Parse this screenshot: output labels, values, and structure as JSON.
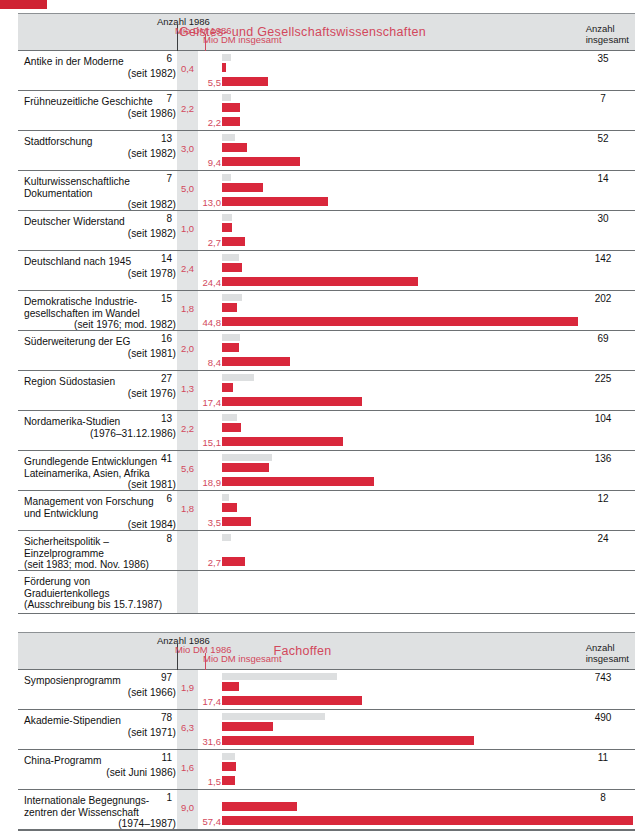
{
  "decoration": {
    "corner_color": "#cf2233"
  },
  "colors": {
    "red": "#d9283c",
    "red_text": "#d2485c",
    "gray_bar": "#dddfe0",
    "band": "#dfe1e2",
    "rule": "#6d7174"
  },
  "sections": [
    {
      "header": {
        "anzahl_label": "Anzahl 1986",
        "mio_1986_label": "Mio DM 1986",
        "mio_total_label": "Mio DM insgesamt",
        "title": "Geistes- und Gesellschaftswissenschaften",
        "right_line1": "Anzahl",
        "right_line2": "insgesamt"
      },
      "rows": [
        {
          "name": "Antike in der Moderne",
          "since": "(seit 1982)",
          "count": "6",
          "mio1986": "0,4",
          "mio_total": "5,5",
          "total": "35",
          "gray_w": 9,
          "red1_w": 4,
          "red2_w": 46
        },
        {
          "name": "Frühneuzeitliche Geschichte",
          "since": "(seit 1986)",
          "count": "7",
          "mio1986": "2,2",
          "mio_total": "2,2",
          "total": "7",
          "gray_w": 9,
          "red1_w": 18,
          "red2_w": 18
        },
        {
          "name": "Stadtforschung",
          "since": "(seit 1982)",
          "count": "13",
          "mio1986": "3,0",
          "mio_total": "9,4",
          "total": "52",
          "gray_w": 13,
          "red1_w": 25,
          "red2_w": 78
        },
        {
          "name": "Kulturwissenschaftliche<br>Dokumentation",
          "since": "(seit 1982)",
          "since_inline": true,
          "count": "7",
          "mio1986": "5,0",
          "mio_total": "13,0",
          "total": "14",
          "gray_w": 9,
          "red1_w": 41,
          "red2_w": 106
        },
        {
          "name": "Deutscher Widerstand",
          "since": "(seit 1982)",
          "count": "8",
          "mio1986": "1,0",
          "mio_total": "2,7",
          "total": "30",
          "gray_w": 10,
          "red1_w": 10,
          "red2_w": 23
        },
        {
          "name": "Deutschland nach 1945",
          "since": "(seit 1978)",
          "count": "14",
          "mio1986": "2,4",
          "mio_total": "24,4",
          "total": "142",
          "gray_w": 17,
          "red1_w": 20,
          "red2_w": 196
        },
        {
          "name": "Demokratische Industrie-<br>gesellschaften im Wandel",
          "since": "(seit 1976; mod. 1982)",
          "count": "15",
          "mio1986": "1,8",
          "mio_total": "44,8",
          "total": "202",
          "gray_w": 20,
          "red1_w": 15,
          "red2_w": 356
        },
        {
          "name": "Süderweiterung der EG",
          "since": "(seit 1981)",
          "count": "16",
          "mio1986": "2,0",
          "mio_total": "8,4",
          "total": "69",
          "gray_w": 18,
          "red1_w": 17,
          "red2_w": 68
        },
        {
          "name": "Region Südostasien",
          "since": "(seit 1976)",
          "count": "27",
          "mio1986": "1,3",
          "mio_total": "17,4",
          "total": "225",
          "gray_w": 32,
          "red1_w": 11,
          "red2_w": 140
        },
        {
          "name": "Nordamerika-Studien",
          "since": "(1976–31.12.1986)",
          "count": "13",
          "mio1986": "2,2",
          "mio_total": "15,1",
          "total": "104",
          "gray_w": 15,
          "red1_w": 19,
          "red2_w": 121
        },
        {
          "name": "Grundlegende Entwicklungen<br>Lateinamerika, Asien, Afrika",
          "since": "(seit 1981)",
          "count": "41",
          "mio1986": "5,6",
          "mio_total": "18,9",
          "total": "136",
          "gray_w": 50,
          "red1_w": 47,
          "red2_w": 152
        },
        {
          "name": "Management von Forschung<br>und Entwicklung",
          "since": "(seit 1984)",
          "count": "6",
          "mio1986": "1,8",
          "mio_total": "3,5",
          "total": "12",
          "gray_w": 7,
          "red1_w": 15,
          "red2_w": 29
        },
        {
          "name": "Sicherheitspolitik –<br>Einzelprogramme",
          "since": "(seit 1983; mod. Nov. 1986)",
          "since_indent": true,
          "count": "8",
          "mio1986": "",
          "mio_total": "2,7",
          "total": "24",
          "gray_w": 9,
          "red1_w": 0,
          "red2_w": 23
        },
        {
          "name": "Förderung von<br>Graduiertenkollegs<br>(Ausschreibung bis 15.7.1987)",
          "since": "",
          "count": "",
          "mio1986": "",
          "mio_total": "",
          "total": "",
          "gray_w": 0,
          "red1_w": 0,
          "red2_w": 0
        }
      ]
    },
    {
      "header": {
        "anzahl_label": "Anzahl 1986",
        "mio_1986_label": "Mio DM 1986",
        "mio_total_label": "Mio DM insgesamt",
        "title": "Fachoffen",
        "right_line1": "Anzahl",
        "right_line2": "insgesamt"
      },
      "rows": [
        {
          "name": "Symposienprogramm",
          "since": "(seit 1966)",
          "count": "97",
          "mio1986": "1,9",
          "mio_total": "17,4",
          "total": "743",
          "gray_w": 115,
          "red1_w": 17,
          "red2_w": 140
        },
        {
          "name": "Akademie-Stipendien",
          "since": "(seit 1971)",
          "count": "78",
          "mio1986": "6,3",
          "mio_total": "31,6",
          "total": "490",
          "gray_w": 103,
          "red1_w": 51,
          "red2_w": 252
        },
        {
          "name": "China-Programm",
          "since": "(seit Juni 1986)",
          "count": "11",
          "mio1986": "1,6",
          "mio_total": "1,5",
          "total": "11",
          "gray_w": 13,
          "red1_w": 14,
          "red2_w": 13
        },
        {
          "name": "Internationale Begegnungs-<br>zentren der Wissenschaft",
          "since": "(1974–1987)",
          "count": "1",
          "mio1986": "9,0",
          "mio_total": "57,4",
          "total": "8",
          "gray_w": 0,
          "red1_w": 75,
          "red2_w": 411,
          "wrap_w": 58
        }
      ]
    }
  ]
}
